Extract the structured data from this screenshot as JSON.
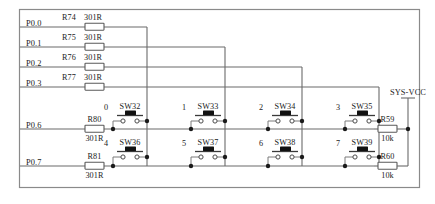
{
  "diagram": {
    "net_label": "SYS-VCC",
    "wire_color": "#6b6b6b",
    "frame_color": "#8a8a8a",
    "junction_color": "#1a1a1a"
  },
  "ports": [
    {
      "name": "P0.0",
      "ref": "R74",
      "value": "301R"
    },
    {
      "name": "P0.1",
      "ref": "R75",
      "value": "301R"
    },
    {
      "name": "P0.2",
      "ref": "R76",
      "value": "301R"
    },
    {
      "name": "P0.3",
      "ref": "R77",
      "value": "301R"
    },
    {
      "name": "P0.6",
      "ref": "R80",
      "value": "301R"
    },
    {
      "name": "P0.7",
      "ref": "R81",
      "value": "301R"
    }
  ],
  "switches": [
    {
      "index": "0",
      "ref": "SW32"
    },
    {
      "index": "1",
      "ref": "SW33"
    },
    {
      "index": "2",
      "ref": "SW34"
    },
    {
      "index": "3",
      "ref": "SW35"
    },
    {
      "index": "4",
      "ref": "SW36"
    },
    {
      "index": "5",
      "ref": "SW37"
    },
    {
      "index": "6",
      "ref": "SW38"
    },
    {
      "index": "7",
      "ref": "SW39"
    }
  ],
  "pullups": [
    {
      "ref": "R59",
      "value": "10k"
    },
    {
      "ref": "R60",
      "value": "10k"
    }
  ]
}
